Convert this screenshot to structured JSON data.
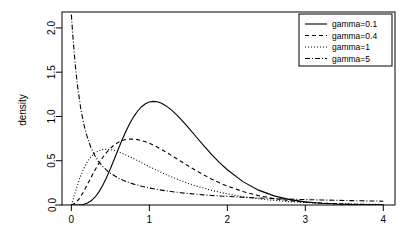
{
  "chart_data": {
    "type": "line",
    "title": "",
    "xlabel": "",
    "ylabel": "density",
    "xlim": [
      -0.12,
      4.15
    ],
    "ylim": [
      0.0,
      2.18
    ],
    "xticks": [
      "0",
      "1",
      "2",
      "3",
      "4"
    ],
    "xtick_values": [
      0,
      1,
      2,
      3,
      4
    ],
    "yticks": [
      "0.0",
      "0.5",
      "1.0",
      "1.5",
      "2.0"
    ],
    "ytick_values": [
      0.0,
      0.5,
      1.0,
      1.5,
      2.0
    ],
    "grid": false,
    "legend_position": "top-right",
    "series": [
      {
        "name": "gamma=0.1",
        "style": "solid",
        "peak_x": 0.92,
        "peak_y": 1.33,
        "x": [
          0.0,
          0.05,
          0.1,
          0.15,
          0.2,
          0.25,
          0.3,
          0.35,
          0.4,
          0.45,
          0.5,
          0.55,
          0.6,
          0.65,
          0.7,
          0.75,
          0.8,
          0.85,
          0.9,
          0.95,
          1.0,
          1.05,
          1.1,
          1.15,
          1.2,
          1.25,
          1.3,
          1.35,
          1.4,
          1.45,
          1.5,
          1.6,
          1.7,
          1.8,
          1.9,
          2.0,
          2.2,
          2.4,
          2.6,
          2.8,
          3.0,
          3.2,
          3.4,
          3.6,
          3.8,
          4.0
        ],
        "y": [
          0.0,
          0.0,
          0.001,
          0.006,
          0.019,
          0.044,
          0.085,
          0.143,
          0.218,
          0.308,
          0.409,
          0.517,
          0.627,
          0.734,
          0.834,
          0.923,
          0.999,
          1.062,
          1.11,
          1.143,
          1.163,
          1.17,
          1.166,
          1.151,
          1.128,
          1.097,
          1.06,
          1.018,
          0.972,
          0.924,
          0.874,
          0.771,
          0.668,
          0.57,
          0.479,
          0.398,
          0.264,
          0.168,
          0.103,
          0.061,
          0.035,
          0.02,
          0.011,
          0.006,
          0.003,
          0.002
        ]
      },
      {
        "name": "gamma=0.4",
        "style": "dashed",
        "peak_x": 0.68,
        "peak_y": 0.78,
        "x": [
          0.0,
          0.05,
          0.1,
          0.15,
          0.2,
          0.25,
          0.3,
          0.35,
          0.4,
          0.45,
          0.5,
          0.55,
          0.6,
          0.65,
          0.7,
          0.75,
          0.8,
          0.85,
          0.9,
          0.95,
          1.0,
          1.1,
          1.2,
          1.3,
          1.4,
          1.5,
          1.6,
          1.7,
          1.8,
          1.9,
          2.0,
          2.2,
          2.4,
          2.6,
          2.8,
          3.0,
          3.2,
          3.4,
          3.6,
          3.8,
          4.0
        ],
        "y": [
          0.0,
          0.02,
          0.07,
          0.14,
          0.222,
          0.307,
          0.39,
          0.466,
          0.534,
          0.592,
          0.64,
          0.678,
          0.707,
          0.727,
          0.739,
          0.745,
          0.744,
          0.738,
          0.728,
          0.714,
          0.697,
          0.655,
          0.605,
          0.551,
          0.496,
          0.441,
          0.388,
          0.338,
          0.292,
          0.25,
          0.213,
          0.152,
          0.106,
          0.073,
          0.049,
          0.033,
          0.022,
          0.014,
          0.009,
          0.006,
          0.004
        ]
      },
      {
        "name": "gamma=1",
        "style": "dotted",
        "peak_x": 0.42,
        "peak_y": 0.63,
        "x": [
          0.0,
          0.05,
          0.1,
          0.15,
          0.2,
          0.25,
          0.3,
          0.35,
          0.4,
          0.45,
          0.5,
          0.55,
          0.6,
          0.65,
          0.7,
          0.75,
          0.8,
          0.9,
          1.0,
          1.1,
          1.2,
          1.3,
          1.4,
          1.5,
          1.6,
          1.8,
          2.0,
          2.2,
          2.4,
          2.6,
          2.8,
          3.0,
          3.2,
          3.4,
          3.6,
          3.8,
          4.0
        ],
        "y": [
          0.0,
          0.145,
          0.283,
          0.396,
          0.482,
          0.545,
          0.587,
          0.613,
          0.626,
          0.629,
          0.625,
          0.615,
          0.601,
          0.584,
          0.565,
          0.544,
          0.523,
          0.478,
          0.433,
          0.39,
          0.349,
          0.311,
          0.276,
          0.244,
          0.215,
          0.165,
          0.125,
          0.094,
          0.07,
          0.052,
          0.038,
          0.028,
          0.02,
          0.015,
          0.011,
          0.008,
          0.006
        ]
      },
      {
        "name": "gamma=5",
        "style": "dashdot",
        "peak_x": 0.0,
        "peak_y": 2.15,
        "x": [
          0.0,
          0.02,
          0.05,
          0.08,
          0.12,
          0.16,
          0.2,
          0.25,
          0.3,
          0.35,
          0.4,
          0.45,
          0.5,
          0.6,
          0.7,
          0.8,
          0.9,
          1.0,
          1.1,
          1.2,
          1.3,
          1.4,
          1.5,
          1.6,
          1.7,
          1.8,
          1.9,
          2.0,
          2.2,
          2.4,
          2.6,
          2.8,
          3.0,
          3.2,
          3.4,
          3.6,
          3.8,
          4.0
        ],
        "y": [
          2.15,
          1.9,
          1.58,
          1.34,
          1.09,
          0.91,
          0.78,
          0.65,
          0.56,
          0.49,
          0.437,
          0.394,
          0.359,
          0.305,
          0.266,
          0.236,
          0.212,
          0.192,
          0.176,
          0.162,
          0.15,
          0.139,
          0.13,
          0.122,
          0.114,
          0.108,
          0.102,
          0.097,
          0.087,
          0.079,
          0.072,
          0.066,
          0.061,
          0.057,
          0.053,
          0.049,
          0.046,
          0.043
        ]
      }
    ]
  },
  "legend": {
    "items": [
      {
        "label": "gamma=0.1",
        "style": "solid"
      },
      {
        "label": "gamma=0.4",
        "style": "dashed"
      },
      {
        "label": "gamma=1",
        "style": "dotted"
      },
      {
        "label": "gamma=5",
        "style": "dashdot"
      }
    ]
  },
  "colors": {
    "background": "#ffffff",
    "line": "#000000",
    "axis": "#000000"
  }
}
